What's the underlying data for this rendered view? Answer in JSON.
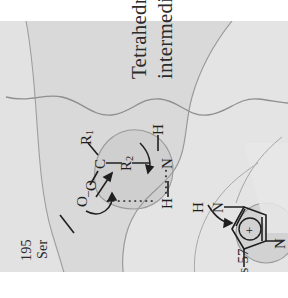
{
  "figure": {
    "kind": "enzyme-mechanism-diagram",
    "caption_label": "Tetrahedral\nintermediate",
    "caption_line1": "Tetrahedral",
    "caption_line2": "intermediate",
    "residues": {
      "histidine": {
        "name": "His 57",
        "line1": "His 57"
      },
      "serine": {
        "name": "Ser 195",
        "line1": "Ser",
        "line2": "195"
      }
    },
    "atoms": {
      "his_n_top": "N",
      "his_h_top": "H",
      "his_n_bottom": "N",
      "ring_charge": "+",
      "bridging_h": "H",
      "amide_n": "N",
      "amide_h": "H",
      "r2": "R",
      "r2_sub": "2",
      "carbonyl_c": "C",
      "r1": "R",
      "r1_sub": "1",
      "ser_o": "O",
      "oxyanion_o": "O",
      "oxyanion_charge": "–"
    },
    "colors": {
      "background": "#ffffff",
      "surface_light": "#e6e6e6",
      "surface_mid": "#d9d9d9",
      "surface_dark": "#c6c6c6",
      "surface_darker": "#bcbcbc",
      "contour_line": "#8f8f8f",
      "ink": "#1f1f1f",
      "label_ink": "#2b2b2b"
    },
    "bond_notes": {
      "hydrogen_bond_ser_to_his": "O···H",
      "hydrogen_bond_h_to_n": "H···N",
      "arrow_o_to_c": "nucleophilic attack",
      "arrow_oxyanion": "electron pair reforms carbonyl",
      "arrow_n_lone_pair": "proton transfer to leaving nitrogen",
      "arrow_ring_n": "imidazole nitrogen lone pair"
    }
  }
}
